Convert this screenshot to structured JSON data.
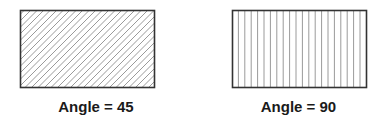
{
  "panels": [
    {
      "label": "Angle = 45",
      "hatch_angle": 45,
      "rect": {
        "x": 20,
        "y": 10,
        "w": 135,
        "h": 78
      }
    },
    {
      "label": "Angle = 90",
      "hatch_angle": 90,
      "rect": {
        "x": 40,
        "y": 10,
        "w": 135,
        "h": 78
      }
    }
  ],
  "colors": {
    "border": "#333333",
    "hatch": "#999999"
  }
}
